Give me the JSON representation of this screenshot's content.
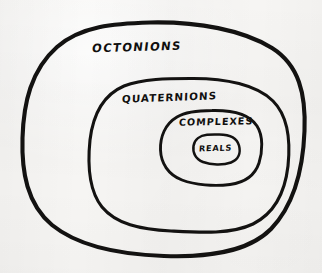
{
  "image": {
    "kind": "hand-drawn-euler-diagram",
    "subject": "nested number systems",
    "background_color": "#f6f5f3",
    "ink_color": "#131211",
    "width": 322,
    "height": 273
  },
  "diagram": {
    "type": "nested-ellipses",
    "nesting_order": [
      "OCTONIONS",
      "QUATERNIONS",
      "COMPLEXES",
      "REALS"
    ],
    "regions": [
      {
        "id": "octonions",
        "label": "OCTONIONS",
        "level": 1,
        "stroke_width": 4.1,
        "bounds": {
          "x": 22,
          "y": 22,
          "width": 283,
          "height": 234
        },
        "label_position": {
          "x": 92,
          "y": 42
        }
      },
      {
        "id": "quaternions",
        "label": "QUATERNIONS",
        "level": 2,
        "stroke_width": 3.1,
        "bounds": {
          "x": 88,
          "y": 78,
          "width": 202,
          "height": 154
        },
        "label_position": {
          "x": 122,
          "y": 92
        }
      },
      {
        "id": "complexes",
        "label": "COMPLEXES",
        "level": 3,
        "stroke_width": 2.9,
        "bounds": {
          "x": 160,
          "y": 110,
          "width": 102,
          "height": 75
        },
        "label_position": {
          "x": 179,
          "y": 117
        }
      },
      {
        "id": "reals",
        "label": "REALS",
        "level": 4,
        "stroke_width": 2.5,
        "bounds": {
          "x": 193,
          "y": 134,
          "width": 47,
          "height": 30
        },
        "label_position": {
          "x": 199,
          "y": 144
        }
      }
    ]
  },
  "paths": {
    "octonions": "M 150 22.5 C 198 21.5 243 30 272 48 C 299 65 306 94 304.5 131 C 303 170 294 205 271 229 C 247 253 206 257.5 164 256 C 121 254.5 79 247 52 225 C 27 204 21.5 172 22.5 138 C 23.5 103 31 70 57 47 C 81 26 114 23.5 150 22.5 Z",
    "quaternions": "M 190 78.5 C 226 78 257 85 273 101 C 289 117 290.5 142 288 166 C 285 192 275 213 253 224 C 231 234.5 200 232.5 171 231 C 140 229.5 116 224 102 207 C 88.5 190 87.5 164 90 140 C 93 115 103 95 124 86 C 143 78.5 168 78.5 190 78.5 Z",
    "complexes": "M 212 110.5 C 234 110 250 115 257 126 C 263.5 136 262.5 152 259 163 C 255 175 245 182.5 230 184.5 C 214 186.5 195 185 182 180 C 168 174.5 161 163 160.5 150 C 160 137 165 124 177 117 C 187 111 200 110.5 212 110.5 Z",
    "reals": "M 217 134.5 C 229 134 237 138 239 145.5 C 241 153 238.5 159.5 231 162.5 C 223 165.5 211 165 203 162 C 195.5 159 192.5 152.5 193.5 146 C 194.5 139.5 200 135.5 207 134.8 C 210.5 134.4 214 134.5 217 134.5 Z"
  }
}
